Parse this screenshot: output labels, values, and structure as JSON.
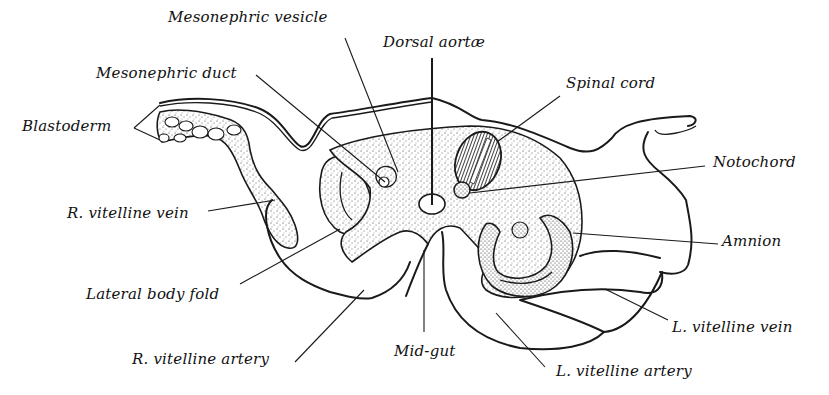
{
  "figure": {
    "type": "embryology cross-section diagram",
    "background": "#ffffff",
    "ink_color": "#1a1a1a"
  },
  "labels": [
    {
      "id": "mesonephric-vesicle",
      "text": "Mesonephric vesicle",
      "x": 168,
      "y": 10
    },
    {
      "id": "dorsal-aortae",
      "text": "Dorsal aortæ",
      "x": 383,
      "y": 35
    },
    {
      "id": "mesonephric-duct",
      "text": "Mesonephric duct",
      "x": 96,
      "y": 66
    },
    {
      "id": "spinal-cord",
      "text": "Spinal cord",
      "x": 566,
      "y": 76
    },
    {
      "id": "blastoderm",
      "text": "Blastoderm",
      "x": 22,
      "y": 119
    },
    {
      "id": "notochord",
      "text": "Notochord",
      "x": 713,
      "y": 155
    },
    {
      "id": "r-vitelline-vein",
      "text": "R. vitelline vein",
      "x": 67,
      "y": 206
    },
    {
      "id": "amnion",
      "text": "Amnion",
      "x": 722,
      "y": 234
    },
    {
      "id": "lateral-body-fold",
      "text": "Lateral body fold",
      "x": 86,
      "y": 287
    },
    {
      "id": "l-vitelline-vein",
      "text": "L. vitelline vein",
      "x": 672,
      "y": 320
    },
    {
      "id": "mid-gut",
      "text": "Mid-gut",
      "x": 394,
      "y": 344
    },
    {
      "id": "r-vitelline-artery",
      "text": "R. vitelline artery",
      "x": 132,
      "y": 352
    },
    {
      "id": "l-vitelline-artery",
      "text": "L. vitelline artery",
      "x": 556,
      "y": 364
    }
  ],
  "leader_lines": [
    {
      "label": "mesonephric-vesicle",
      "x1": 345,
      "y1": 38,
      "x2": 398,
      "y2": 172
    },
    {
      "label": "dorsal-aortae",
      "x1": 432,
      "y1": 58,
      "x2": 432,
      "y2": 205
    },
    {
      "label": "mesonephric-duct",
      "x1": 256,
      "y1": 75,
      "x2": 385,
      "y2": 182
    },
    {
      "label": "spinal-cord",
      "x1": 560,
      "y1": 96,
      "x2": 497,
      "y2": 142
    },
    {
      "label": "blastoderm-upper",
      "x1": 134,
      "y1": 128,
      "x2": 160,
      "y2": 105
    },
    {
      "label": "blastoderm-lower",
      "x1": 134,
      "y1": 128,
      "x2": 160,
      "y2": 140
    },
    {
      "label": "notochord",
      "x1": 705,
      "y1": 166,
      "x2": 470,
      "y2": 193
    },
    {
      "label": "r-vitelline-vein",
      "x1": 208,
      "y1": 211,
      "x2": 275,
      "y2": 200
    },
    {
      "label": "amnion",
      "x1": 718,
      "y1": 244,
      "x2": 573,
      "y2": 233
    },
    {
      "label": "lateral-body-fold",
      "x1": 240,
      "y1": 284,
      "x2": 340,
      "y2": 229
    },
    {
      "label": "l-vitelline-vein",
      "x1": 668,
      "y1": 320,
      "x2": 605,
      "y2": 289
    },
    {
      "label": "mid-gut",
      "x1": 424,
      "y1": 332,
      "x2": 424,
      "y2": 250
    },
    {
      "label": "r-vitelline-artery",
      "x1": 295,
      "y1": 362,
      "x2": 364,
      "y2": 290
    },
    {
      "label": "l-vitelline-artery",
      "x1": 545,
      "y1": 367,
      "x2": 496,
      "y2": 313
    }
  ]
}
